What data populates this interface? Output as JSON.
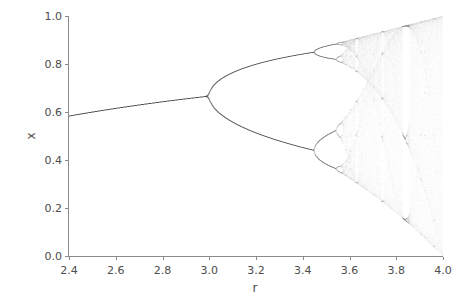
{
  "chart_data": {
    "type": "scatter",
    "title": "",
    "xlabel": "r",
    "ylabel": "x",
    "xlim": [
      2.4,
      4.0
    ],
    "ylim": [
      0.0,
      1.0
    ],
    "xticks": [
      2.4,
      2.6,
      2.8,
      3.0,
      3.2,
      3.4,
      3.6,
      3.8,
      4.0
    ],
    "xticklabels": [
      "2.4",
      "2.6",
      "2.8",
      "3.0",
      "3.2",
      "3.4",
      "3.6",
      "3.8",
      "4.0"
    ],
    "yticks": [
      0.0,
      0.2,
      0.4,
      0.6,
      0.8,
      1.0
    ],
    "yticklabels": [
      "0.0",
      "0.2",
      "0.4",
      "0.6",
      "0.8",
      "1.0"
    ],
    "grid": false,
    "legend": null,
    "map": "logistic",
    "equation": "x_{n+1} = r * x_n * (1 - x_n)",
    "r_min": 2.4,
    "r_max": 4.0,
    "r_steps": 1400,
    "iterations_discarded": 200,
    "iterations_plotted": 180,
    "x0": 0.2,
    "point_color": "#4d4d4d",
    "point_alpha": 0.035,
    "point_size": 0.6,
    "features": {
      "fixed_point_branch_end_r": 3.0,
      "period_2_onset_r": 3.0,
      "period_4_onset_r": 3.449,
      "period_8_onset_r": 3.544,
      "chaos_onset_r": 3.5699,
      "periodic_windows_r": [
        3.63,
        3.74,
        3.83
      ],
      "period_3_window_r": 3.828,
      "upper_envelope_at_r4": 1.0,
      "lower_envelope_at_r4": 0.0
    },
    "axis_color": "#8a8a8a",
    "tick_label_color": "#4d4d4d",
    "background_color": "#ffffff"
  },
  "figure": {
    "width": 463,
    "height": 301,
    "axes_left": 68,
    "axes_top": 16,
    "axes_width": 374,
    "axes_height": 240
  }
}
